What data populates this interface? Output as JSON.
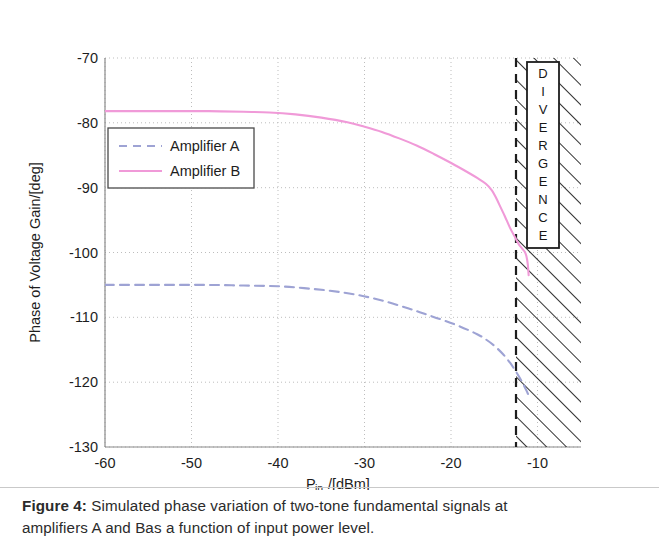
{
  "caption": {
    "figure_label": "Figure 4:",
    "text_line1": " Simulated phase variation of two-tone fundamental signals at",
    "text_line2": "amplifiers A and Bas a function of input power level."
  },
  "chart_data": {
    "type": "line",
    "title": "",
    "xlabel_main": "P",
    "xlabel_sub": "in",
    "xlabel_rest": "/[dBm]",
    "xlabel": "P_in/[dBm]",
    "ylabel": "Phase of Voltage Gain/[deg]",
    "xlim": [
      -60,
      -5
    ],
    "ylim": [
      -130,
      -70
    ],
    "xticks": [
      -60,
      -50,
      -40,
      -30,
      -20,
      -10
    ],
    "xtick_labels": [
      "-60",
      "-50",
      "-40",
      "-30",
      "-20",
      "-10"
    ],
    "yticks": [
      -130,
      -120,
      -110,
      -100,
      -90,
      -80,
      -70
    ],
    "ytick_labels": [
      "-130",
      "-120",
      "-110",
      "-100",
      "-90",
      "-80",
      "-70"
    ],
    "grid": true,
    "legend_position": "upper-left",
    "colors": {
      "amplifier_a": "#9ea3d4",
      "amplifier_b": "#f09ad8",
      "axis": "#8a8a8a",
      "grid": "#bdbdbd",
      "divergence": "#1d1d1d"
    },
    "series": [
      {
        "name": "Amplifier A",
        "style": "dashed",
        "color": "#9ea3d4",
        "x": [
          -60,
          -56,
          -52,
          -48,
          -44,
          -40,
          -37,
          -34,
          -31,
          -28,
          -25,
          -23,
          -21,
          -19,
          -17,
          -16,
          -15,
          -14,
          -13.2,
          -12.5,
          -12,
          -11.6,
          -11.3,
          -11.1
        ],
        "y": [
          -105.0,
          -105.0,
          -105.0,
          -105.0,
          -105.1,
          -105.2,
          -105.5,
          -105.9,
          -106.5,
          -107.4,
          -108.6,
          -109.5,
          -110.4,
          -111.4,
          -112.6,
          -113.4,
          -114.4,
          -115.7,
          -117.0,
          -118.4,
          -119.5,
          -120.5,
          -121.3,
          -121.9
        ]
      },
      {
        "name": "Amplifier B",
        "style": "solid",
        "color": "#f09ad8",
        "x": [
          -60,
          -56,
          -52,
          -48,
          -44,
          -41,
          -38,
          -35,
          -32,
          -30,
          -28,
          -26,
          -24,
          -22,
          -20,
          -18,
          -17,
          -16,
          -15.3,
          -14.8,
          -14.3,
          -13.8,
          -13.2,
          -12.6,
          -12.2,
          -11.8,
          -11.5,
          -11.3,
          -11.15,
          -11.05
        ],
        "y": [
          -78.2,
          -78.2,
          -78.2,
          -78.2,
          -78.3,
          -78.4,
          -78.7,
          -79.2,
          -79.9,
          -80.6,
          -81.4,
          -82.4,
          -83.5,
          -84.8,
          -86.2,
          -87.7,
          -88.5,
          -89.4,
          -90.4,
          -91.6,
          -93.0,
          -94.4,
          -96.2,
          -97.7,
          -98.7,
          -99.4,
          -99.9,
          -100.6,
          -101.8,
          -103.5
        ]
      }
    ],
    "annotations": [
      {
        "name": "divergence-box",
        "label": "DIVERGENCE",
        "letters": [
          "D",
          "I",
          "V",
          "E",
          "R",
          "G",
          "E",
          "N",
          "C",
          "E"
        ],
        "x_start": -11.1,
        "region": "hatched"
      }
    ],
    "legend": [
      {
        "label": "Amplifier A",
        "style": "dashed",
        "color": "#9ea3d4"
      },
      {
        "label": "Amplifier B",
        "style": "solid",
        "color": "#f09ad8"
      }
    ]
  }
}
